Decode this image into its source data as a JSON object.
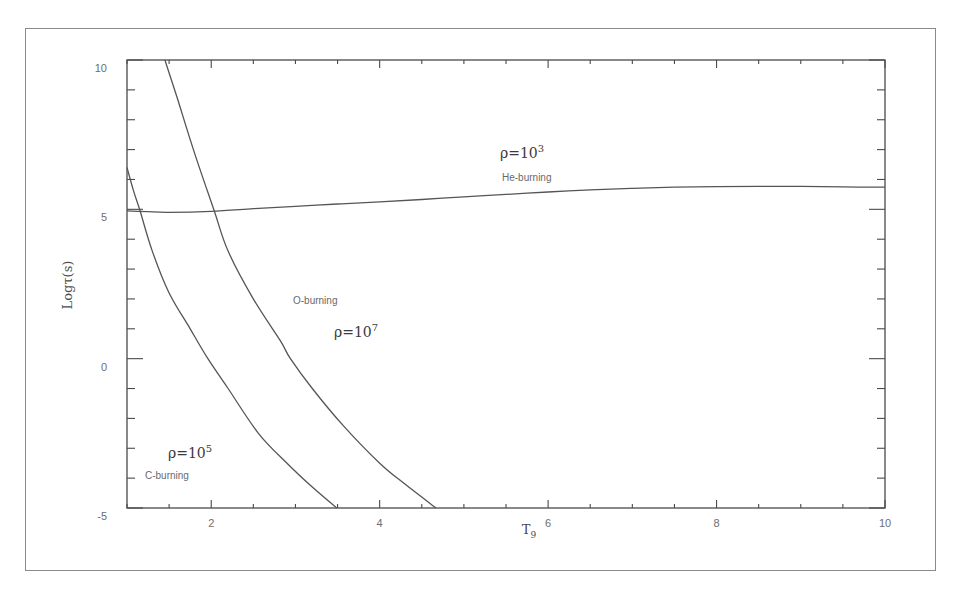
{
  "chart_data": {
    "type": "line",
    "title": "",
    "xlabel": "T9",
    "xlabel_main": "T",
    "xlabel_sub": "9",
    "ylabel": "Logτ(s)",
    "xlim": [
      1,
      10
    ],
    "ylim": [
      -5,
      10
    ],
    "xticks": [
      2,
      4,
      6,
      8,
      10
    ],
    "xtick_labels": [
      "2",
      "4",
      "6",
      "8",
      "10"
    ],
    "x_minor_step": 0.5,
    "yticks": [
      -5,
      0,
      5,
      10
    ],
    "ytick_labels": [
      "-5",
      "0",
      "5",
      "10"
    ],
    "y_minor_step": 1,
    "grid": false,
    "legend": null,
    "series": [
      {
        "name": "He-burning (ρ=10³)",
        "label": "He-burning",
        "density_label": "ρ=10",
        "density_exp": "3",
        "x": [
          1.0,
          1.25,
          1.5,
          2.0,
          2.5,
          3.0,
          3.5,
          4.0,
          4.5,
          5.0,
          5.5,
          6.0,
          6.5,
          7.0,
          7.5,
          8.0,
          8.5,
          9.0,
          9.5,
          10.0
        ],
        "y": [
          4.95,
          4.92,
          4.9,
          4.93,
          5.02,
          5.1,
          5.18,
          5.25,
          5.33,
          5.42,
          5.5,
          5.58,
          5.65,
          5.7,
          5.74,
          5.76,
          5.77,
          5.77,
          5.75,
          5.74
        ]
      },
      {
        "name": "O-burning (ρ=10⁷)",
        "label": "O-burning",
        "density_label": "ρ=10",
        "density_exp": "7",
        "x": [
          1.45,
          1.6,
          1.8,
          2.03,
          2.2,
          2.5,
          2.82,
          2.94,
          3.2,
          3.57,
          4.0,
          4.3,
          4.67
        ],
        "y": [
          10.0,
          8.7,
          6.9,
          5.0,
          3.6,
          2.0,
          0.6,
          0.0,
          -1.0,
          -2.25,
          -3.5,
          -4.2,
          -5.0
        ]
      },
      {
        "name": "C-burning (ρ=10⁵)",
        "label": "C-burning",
        "density_label": "ρ=10",
        "density_exp": "5",
        "x": [
          1.0,
          1.08,
          1.15,
          1.3,
          1.5,
          1.75,
          1.96,
          2.2,
          2.56,
          2.9,
          3.2,
          3.49
        ],
        "y": [
          6.4,
          5.6,
          5.0,
          3.6,
          2.2,
          1.0,
          0.0,
          -1.0,
          -2.5,
          -3.5,
          -4.3,
          -5.0
        ]
      }
    ],
    "annotations": [
      {
        "text": "ρ=10³",
        "x": 5.1,
        "y": 6.95
      },
      {
        "text": "He-burning",
        "x": 5.1,
        "y": 6.25
      },
      {
        "text": "O-burning",
        "x": 3.75,
        "y": 2.15
      },
      {
        "text": "ρ=10⁷",
        "x": 4.25,
        "y": 0.9
      },
      {
        "text": "ρ=10⁵",
        "x": 1.78,
        "y": -3.3
      },
      {
        "text": "C-burning",
        "x": 1.65,
        "y": -4.05
      }
    ]
  }
}
